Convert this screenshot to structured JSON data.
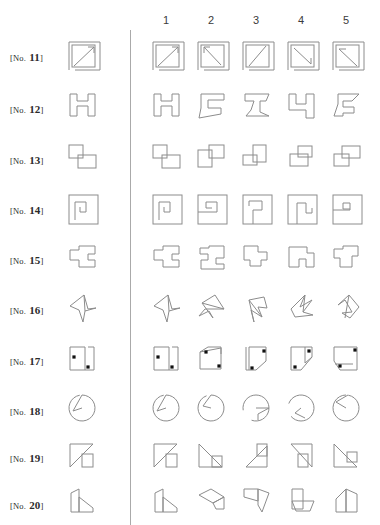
{
  "page": {
    "width": 380,
    "height": 525,
    "background": "#ffffff",
    "stroke_color": "#8c8c8c",
    "dot_color": "#101010",
    "divider_color": "#aaaaaa"
  },
  "column_headers": [
    {
      "label": "1",
      "x": 166
    },
    {
      "label": "2",
      "x": 211
    },
    {
      "label": "3",
      "x": 256
    },
    {
      "label": "4",
      "x": 301
    },
    {
      "label": "5",
      "x": 346
    }
  ],
  "divider": {
    "x": 130,
    "y_top": 30,
    "y_bottom": 525
  },
  "rows": [
    {
      "label_prefix": "[No.",
      "number": "11",
      "label_suffix": "]",
      "label_x": 10,
      "label_y": 60,
      "y": 38,
      "question_kind": "square-with-diagonal-arrow",
      "options": [
        "rotated-0",
        "rotated-90",
        "rotated-180",
        "rotated-270",
        "mirrored"
      ]
    },
    {
      "label_prefix": "[No.",
      "number": "12",
      "label_suffix": "]",
      "label_x": 10,
      "label_y": 112,
      "y": 90,
      "question_kind": "bracket-zigzag",
      "options": [
        "rotated-0",
        "rotated-90",
        "rotated-180",
        "rotated-270",
        "mirrored"
      ]
    },
    {
      "label_prefix": "[No.",
      "number": "13",
      "label_suffix": "]",
      "label_x": 10,
      "label_y": 163,
      "y": 142,
      "question_kind": "two-overlapping-rectangles",
      "options": [
        "rotated-0",
        "rotated-90",
        "rotated-180",
        "rotated-270",
        "mirrored"
      ]
    },
    {
      "label_prefix": "[No.",
      "number": "14",
      "label_suffix": "]",
      "label_x": 10,
      "label_y": 213,
      "y": 192,
      "question_kind": "square-spiral",
      "options": [
        "rotated-0",
        "rotated-90",
        "rotated-180",
        "rotated-270",
        "mirrored"
      ]
    },
    {
      "label_prefix": "[No.",
      "number": "15",
      "label_suffix": "]",
      "label_x": 10,
      "label_y": 263,
      "y": 242,
      "question_kind": "stepped-polyomino",
      "options": [
        "rotated-0",
        "rotated-90",
        "rotated-180",
        "rotated-270",
        "mirrored"
      ]
    },
    {
      "label_prefix": "[No.",
      "number": "16",
      "label_suffix": "]",
      "label_x": 10,
      "label_y": 313,
      "y": 291,
      "question_kind": "angular-star-arrow",
      "options": [
        "rotated-0",
        "rotated-90",
        "rotated-180",
        "rotated-270",
        "mirrored"
      ]
    },
    {
      "label_prefix": "[No.",
      "number": "17",
      "label_suffix": "]",
      "label_x": 10,
      "label_y": 364,
      "y": 343,
      "question_kind": "cut-corner-square-with-two-dots",
      "options": [
        "rotated-0",
        "rotated-90",
        "rotated-180",
        "rotated-270",
        "mirrored"
      ]
    },
    {
      "label_prefix": "[No.",
      "number": "18",
      "label_suffix": "]",
      "label_x": 10,
      "label_y": 414,
      "y": 392,
      "question_kind": "pie-with-wedge-notch",
      "options": [
        "rotated-0",
        "rotated-90",
        "rotated-180",
        "rotated-270",
        "mirrored"
      ]
    },
    {
      "label_prefix": "[No.",
      "number": "19",
      "label_suffix": "]",
      "label_x": 10,
      "label_y": 461,
      "y": 440,
      "question_kind": "square-with-diagonal-and-small-square",
      "options": [
        "rotated-0",
        "rotated-90",
        "rotated-180",
        "rotated-270",
        "mirrored"
      ]
    },
    {
      "label_prefix": "[No.",
      "number": "20",
      "label_suffix": "]",
      "label_x": 10,
      "label_y": 508,
      "y": 485,
      "question_kind": "angled-quadrilateral-pair",
      "options": [
        "rotated-0",
        "rotated-90",
        "rotated-180",
        "rotated-270",
        "mirrored"
      ]
    }
  ]
}
